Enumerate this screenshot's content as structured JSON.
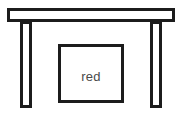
{
  "figure": {
    "background_color": "#ffffff",
    "stroke_color": "#1c1c1c",
    "fill_color": "#ffffff",
    "stroke_width": 3
  },
  "shapes": {
    "top_bar": {
      "name": "horizontal top bar",
      "x": 7,
      "y": 8,
      "width": 168,
      "height": 14
    },
    "left_leg": {
      "name": "left vertical leg",
      "x": 20,
      "y": 22,
      "width": 12,
      "height": 85
    },
    "right_leg": {
      "name": "right vertical leg",
      "x": 150,
      "y": 22,
      "width": 12,
      "height": 85
    },
    "center_square": {
      "name": "center square",
      "x": 58,
      "y": 44,
      "width": 66,
      "height": 59
    }
  },
  "labels": {
    "center_square_label": "red",
    "center_square_label_x": 91,
    "center_square_label_y": 78,
    "center_square_label_color": "#4a4a4a",
    "center_square_label_size": "13"
  }
}
